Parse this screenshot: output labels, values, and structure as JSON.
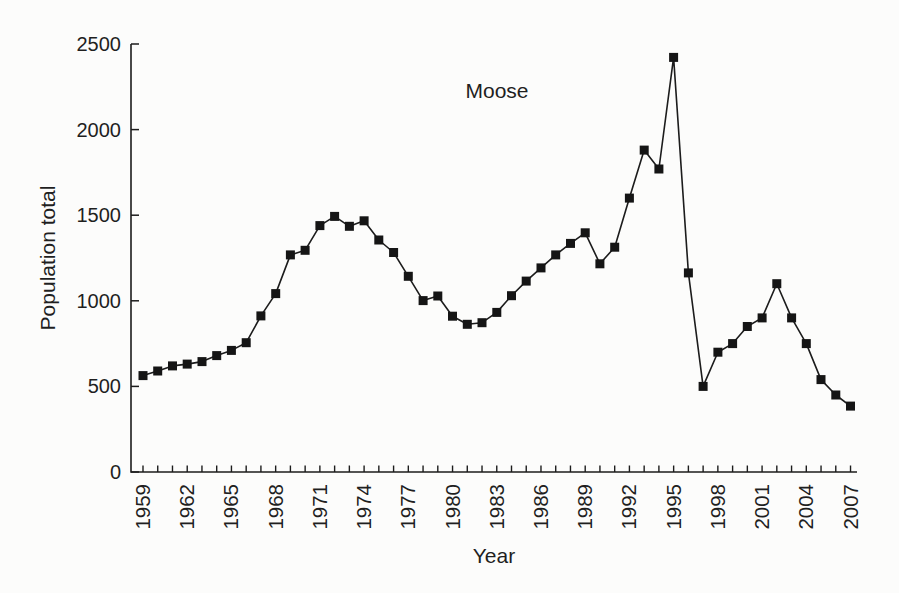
{
  "figure": {
    "annotation": "Moose",
    "xlabel": "Year",
    "ylabel": "Population total"
  },
  "chart_data": {
    "type": "line",
    "series_name": "Moose",
    "x": [
      1959,
      1960,
      1961,
      1962,
      1963,
      1964,
      1965,
      1966,
      1967,
      1968,
      1969,
      1970,
      1971,
      1972,
      1973,
      1974,
      1975,
      1976,
      1977,
      1978,
      1979,
      1980,
      1981,
      1982,
      1983,
      1984,
      1985,
      1986,
      1987,
      1988,
      1989,
      1990,
      1991,
      1992,
      1993,
      1994,
      1995,
      1996,
      1997,
      1998,
      1999,
      2000,
      2001,
      2002,
      2003,
      2004,
      2005,
      2006,
      2007
    ],
    "values": [
      563,
      590,
      620,
      630,
      645,
      680,
      710,
      755,
      912,
      1042,
      1268,
      1295,
      1439,
      1493,
      1435,
      1467,
      1355,
      1282,
      1143,
      1001,
      1028,
      910,
      863,
      872,
      932,
      1030,
      1115,
      1192,
      1268,
      1335,
      1397,
      1216,
      1313,
      1600,
      1880,
      1770,
      2422,
      1163,
      500,
      700,
      750,
      850,
      900,
      1100,
      900,
      750,
      540,
      450,
      385
    ],
    "title": "",
    "annotation": "Moose",
    "xlabel": "Year",
    "ylabel": "Population total",
    "ylim": [
      0,
      2500
    ],
    "xlim": [
      1959,
      2007
    ],
    "yticks": [
      0,
      500,
      1000,
      1500,
      2000,
      2500
    ],
    "xtick_labels": [
      1959,
      1962,
      1965,
      1968,
      1971,
      1974,
      1977,
      1980,
      1983,
      1986,
      1989,
      1992,
      1995,
      1998,
      2001,
      2004,
      2007
    ],
    "xtick_minor_every_year": true,
    "marker": "filled-square",
    "grid": false,
    "legend": "none",
    "ink_color": "#1c1c1c",
    "background_color": "#fcfcfb"
  }
}
